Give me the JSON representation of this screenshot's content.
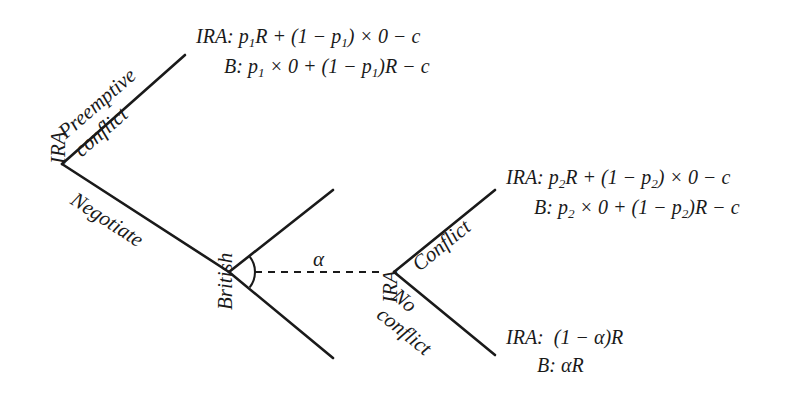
{
  "diagram": {
    "type": "extensive-form-game-tree",
    "title": "",
    "background_color": "#ffffff",
    "line_color": "#1a1a1a",
    "nodes": [
      {
        "id": "n1",
        "label": "IRA",
        "x": 62,
        "y": 164
      },
      {
        "id": "n2",
        "label": "British",
        "x": 229,
        "y": 272
      },
      {
        "id": "n3",
        "label": "IRA",
        "x": 394,
        "y": 272
      }
    ],
    "branches": [
      {
        "id": "b1",
        "from": "n1",
        "label": "Preemptive conflict",
        "label_lines": [
          "Preemptive",
          "conflict"
        ],
        "x1": 62,
        "y1": 164,
        "x2": 185,
        "y2": 55,
        "rotation_deg": -41
      },
      {
        "id": "b2",
        "from": "n1",
        "label": "Negotiate",
        "label_lines": [
          "Negotiate"
        ],
        "x1": 62,
        "y1": 164,
        "x2": 229,
        "y2": 272,
        "rotation_deg": 33
      },
      {
        "id": "b3",
        "from": "n2",
        "label": "",
        "label_lines": [],
        "x1": 229,
        "y1": 272,
        "x2": 333,
        "y2": 190,
        "rotation_deg": -38
      },
      {
        "id": "b4",
        "from": "n2",
        "label": "",
        "label_lines": [],
        "x1": 229,
        "y1": 272,
        "x2": 333,
        "y2": 358,
        "rotation_deg": 38
      },
      {
        "id": "b5",
        "from": "n3",
        "label": "Conflict",
        "label_lines": [
          "Conflict"
        ],
        "x1": 394,
        "y1": 272,
        "x2": 495,
        "y2": 190,
        "rotation_deg": -39
      },
      {
        "id": "b6",
        "from": "n3",
        "label": "No conflict",
        "label_lines": [
          "No",
          "conflict"
        ],
        "x1": 394,
        "y1": 272,
        "x2": 495,
        "y2": 355,
        "rotation_deg": 39
      }
    ],
    "angle_marker": {
      "label": "α",
      "at_node": "n2",
      "arc_radius": 25,
      "dashed_line": {
        "x1": 255,
        "y1": 272,
        "x2": 385,
        "y2": 272
      },
      "label_x": 320,
      "label_y": 250
    },
    "payoffs": [
      {
        "id": "payoff-preemptive-conflict",
        "x": 196,
        "y": 22,
        "rows": [
          {
            "player": "IRA:",
            "expression": "p₁R + (1 − p₁) × 0 − c"
          },
          {
            "player": "B:",
            "expression": "p₁ × 0 + (1 − p₁)R − c"
          }
        ]
      },
      {
        "id": "payoff-conflict",
        "x": 506,
        "y": 163,
        "rows": [
          {
            "player": "IRA:",
            "expression": "p₂R + (1 − p₂) × 0 − c"
          },
          {
            "player": "B:",
            "expression": "p₂ × 0 + (1 − p₂)R − c"
          }
        ]
      },
      {
        "id": "payoff-no-conflict",
        "x": 506,
        "y": 323,
        "rows": [
          {
            "player": "IRA:",
            "expression": "(1 − α)R"
          },
          {
            "player": "B:",
            "expression": "αR"
          }
        ]
      }
    ]
  }
}
